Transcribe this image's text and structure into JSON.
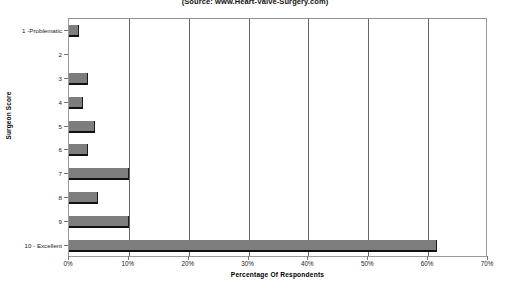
{
  "chart_data": {
    "type": "bar",
    "orientation": "horizontal",
    "title": "(Source: www.Heart-Valve-Surgery.com)",
    "xlabel": "Percentage Of Respondents",
    "ylabel": "Surgeon Score",
    "categories": [
      "1 -Problematic",
      "2",
      "3",
      "4",
      "5",
      "6",
      "7",
      "8",
      "9",
      "10 - Excellent"
    ],
    "values": [
      1.6,
      0,
      3.2,
      2.4,
      4.3,
      3.2,
      10.0,
      4.8,
      10.0,
      61.5
    ],
    "xlim": [
      0,
      70
    ],
    "xticks": [
      0,
      10,
      20,
      30,
      40,
      50,
      60,
      70
    ],
    "xtick_labels": [
      "0%",
      "10%",
      "20%",
      "30%",
      "40%",
      "50%",
      "60%",
      "70%"
    ],
    "grid": true,
    "legend": false,
    "bar_color": "#7d7d7d",
    "bar_edge_color": "#111111",
    "gridline_color": "#666666",
    "frame_color": "#9a9a9a",
    "background": "#ffffff"
  }
}
